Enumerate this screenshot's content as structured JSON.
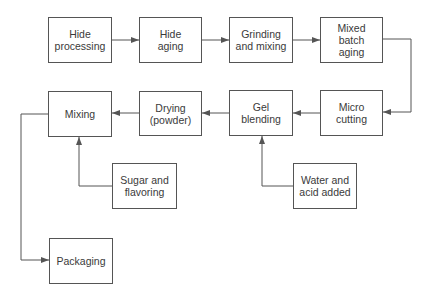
{
  "diagram": {
    "type": "process-flowchart",
    "colors": {
      "line": "#555555",
      "text": "#3a3a3a",
      "background": "#ffffff"
    },
    "nodes": [
      {
        "id": "hide_processing",
        "label": "Hide\nprocessing",
        "x": 48,
        "y": 17,
        "w": 64,
        "h": 46
      },
      {
        "id": "hide_aging",
        "label": "Hide\naging",
        "x": 139,
        "y": 17,
        "w": 63,
        "h": 46
      },
      {
        "id": "grinding_mixing",
        "label": "Grinding\nand mixing",
        "x": 229,
        "y": 17,
        "w": 64,
        "h": 46
      },
      {
        "id": "mixed_batch_aging",
        "label": "Mixed\nbatch\naging",
        "x": 320,
        "y": 17,
        "w": 63,
        "h": 46
      },
      {
        "id": "micro_cutting",
        "label": "Micro\ncutting",
        "x": 320,
        "y": 90,
        "w": 63,
        "h": 46
      },
      {
        "id": "gel_blending",
        "label": "Gel\nblending",
        "x": 229,
        "y": 90,
        "w": 64,
        "h": 46
      },
      {
        "id": "drying_powder",
        "label": "Drying\n(powder)",
        "x": 139,
        "y": 91,
        "w": 63,
        "h": 45
      },
      {
        "id": "mixing",
        "label": "Mixing",
        "x": 48,
        "y": 91,
        "w": 64,
        "h": 46
      },
      {
        "id": "sugar_flavoring",
        "label": "Sugar and\nflavoring",
        "x": 112,
        "y": 163,
        "w": 65,
        "h": 46
      },
      {
        "id": "water_acid",
        "label": "Water and\nacid added",
        "x": 293,
        "y": 163,
        "w": 64,
        "h": 46
      },
      {
        "id": "packaging",
        "label": "Packaging",
        "x": 49,
        "y": 238,
        "w": 64,
        "h": 46
      }
    ],
    "edges": [
      {
        "from": "hide_processing",
        "to": "hide_aging"
      },
      {
        "from": "hide_aging",
        "to": "grinding_mixing"
      },
      {
        "from": "grinding_mixing",
        "to": "mixed_batch_aging"
      },
      {
        "from": "mixed_batch_aging",
        "to": "micro_cutting"
      },
      {
        "from": "micro_cutting",
        "to": "gel_blending"
      },
      {
        "from": "gel_blending",
        "to": "drying_powder"
      },
      {
        "from": "drying_powder",
        "to": "mixing"
      },
      {
        "from": "sugar_flavoring",
        "to": "mixing"
      },
      {
        "from": "water_acid",
        "to": "gel_blending"
      },
      {
        "from": "mixing",
        "to": "packaging"
      }
    ]
  }
}
